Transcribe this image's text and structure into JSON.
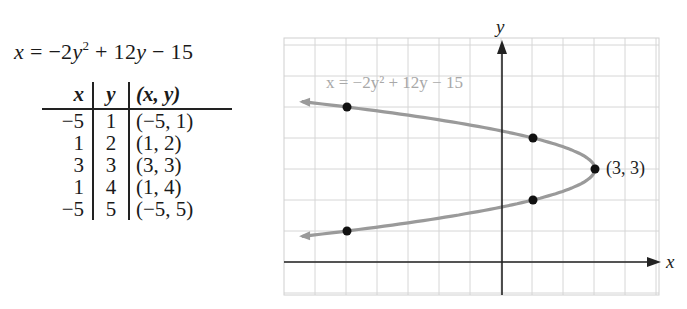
{
  "equation": {
    "lhs": "x",
    "rhs_a": " = −2",
    "rhs_var": "y",
    "rhs_exp": "2",
    "rhs_b": " + 12",
    "rhs_var2": "y",
    "rhs_c": " − 15"
  },
  "table": {
    "headers": [
      "x",
      "y",
      "(x, y)"
    ],
    "rows": [
      [
        "−5",
        "1",
        "(−5, 1)"
      ],
      [
        "1",
        "2",
        "(1, 2)"
      ],
      [
        "3",
        "3",
        "(3, 3)"
      ],
      [
        "1",
        "4",
        "(1, 4)"
      ],
      [
        "−5",
        "5",
        "(−5, 5)"
      ]
    ]
  },
  "graph": {
    "curve_label": "x = −2y² + 12y − 15",
    "vertex_label": "(3, 3)",
    "x_axis_label": "x",
    "y_axis_label": "y",
    "colors": {
      "curve": "#9a9a9a",
      "grid": "#d4d4d4",
      "axis": "#222222",
      "point": "#111111",
      "label": "#a8a8a8"
    }
  },
  "chart_data": {
    "type": "line",
    "title": "x = −2y² + 12y − 15",
    "xlabel": "x",
    "ylabel": "y",
    "xlim": [
      -7,
      5
    ],
    "ylim": [
      -1,
      7.2
    ],
    "grid": true,
    "series": [
      {
        "name": "x = −2y² + 12y − 15",
        "kind": "parabola (opens left)",
        "vertex": [
          3,
          3
        ]
      },
      {
        "name": "plotted points",
        "x": [
          -5,
          1,
          3,
          1,
          -5
        ],
        "y": [
          1,
          2,
          3,
          4,
          5
        ]
      }
    ],
    "annotations": [
      "(3, 3)"
    ]
  }
}
